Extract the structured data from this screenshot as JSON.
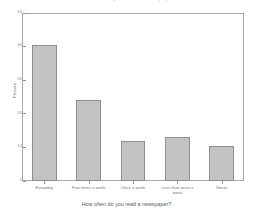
{
  "chart_data": {
    "type": "bar",
    "title": "How often do you read a newspaper?",
    "xlabel": "How often do you read a newspaper?",
    "ylabel": "Percent",
    "categories": [
      "Everyday",
      "Few times a week",
      "Once a week",
      "Less than once a week",
      "Never"
    ],
    "values": [
      40.5,
      24,
      12,
      13,
      10.5
    ],
    "ylim": [
      0,
      50
    ],
    "yticks": [
      0,
      10,
      20,
      30,
      40,
      50
    ],
    "ytick_labels": [
      "0",
      "10",
      "20",
      "30",
      "40",
      "50"
    ],
    "grid": false,
    "legend": null,
    "bar_color": "#c3c3c3",
    "bar_edge_color": "#8f8f8f",
    "axis_color": "#a8a8a8",
    "background": "#ffffff"
  }
}
